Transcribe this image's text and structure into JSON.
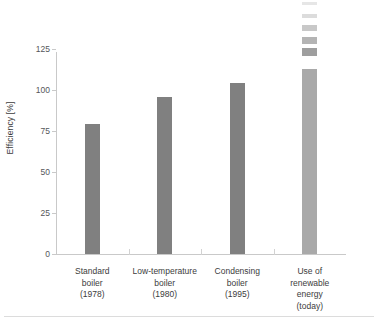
{
  "chart_data": {
    "type": "bar",
    "title": "",
    "subtitle": "",
    "xlabel": "",
    "ylabel": "Efficiency [%]",
    "ylim": [
      0,
      130
    ],
    "yticks": [
      0,
      25,
      50,
      75,
      100,
      125
    ],
    "ytick_labels": [
      "0",
      "25",
      "50",
      "75",
      "100",
      "125"
    ],
    "grid": false,
    "legend": "none",
    "categories": [
      "Standard boiler (1978)",
      "Low-temperature boiler (1980)",
      "Condensing boiler (1995)",
      "Use of renewable energy (today)"
    ],
    "category_lines": [
      [
        "Standard",
        "boiler",
        "(1978)"
      ],
      [
        "Low-temperature",
        "boiler",
        "(1980)"
      ],
      [
        "Condensing",
        "boiler",
        "(1995)"
      ],
      [
        "Use of",
        "renewable",
        "energy",
        "(today)"
      ]
    ],
    "values": [
      79,
      96,
      104,
      113
    ],
    "bar_colors": [
      "#808080",
      "#808080",
      "#808080",
      "#a9a9a9"
    ],
    "annotations": [
      {
        "target_category": "Use of renewable energy (today)",
        "kind": "fading-extension-segments",
        "description": "Stack of progressively lighter bar segments above the fourth bar indicating further potential increase",
        "segment_values": [
          121,
          128,
          136,
          144,
          152
        ],
        "segment_colors": [
          "#9e9e9e",
          "#b4b4b4",
          "#c8c8c8",
          "#dcdcdc",
          "#e6e6e6"
        ]
      }
    ]
  }
}
